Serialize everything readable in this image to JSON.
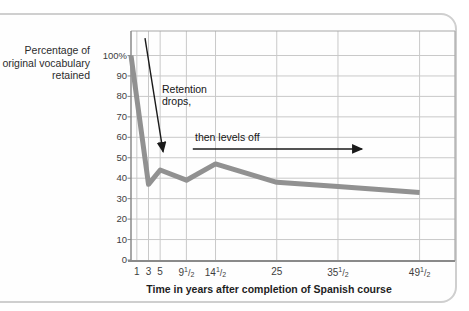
{
  "figure": {
    "y_axis_label_lines": [
      "Percentage of",
      "original vocabulary",
      "retained"
    ]
  },
  "chart_data": {
    "type": "line",
    "title": "",
    "xlabel": "Time in years after completion of Spanish course",
    "ylabel": "Percentage of original vocabulary retained",
    "series": [
      {
        "name": "vocabulary-retention",
        "points": [
          [
            0,
            100
          ],
          [
            3,
            37
          ],
          [
            5,
            44
          ],
          [
            9.5,
            39
          ],
          [
            14.5,
            47
          ],
          [
            25,
            38
          ],
          [
            35.5,
            36
          ],
          [
            49.5,
            33
          ]
        ]
      }
    ],
    "x_ticks": [
      {
        "year": 1,
        "label": "1"
      },
      {
        "year": 3,
        "label": "3"
      },
      {
        "year": 5,
        "label": "5"
      },
      {
        "year": 9.5,
        "label": "9 1/2"
      },
      {
        "year": 14.5,
        "label": "14 1/2"
      },
      {
        "year": 25,
        "label": "25"
      },
      {
        "year": 35.5,
        "label": "35 1/2"
      },
      {
        "year": 49.5,
        "label": "49 1/2"
      }
    ],
    "y_ticks": [
      {
        "value": 100,
        "label": "100%"
      },
      {
        "value": 90,
        "label": "90"
      },
      {
        "value": 80,
        "label": "80"
      },
      {
        "value": 70,
        "label": "70"
      },
      {
        "value": 60,
        "label": "60"
      },
      {
        "value": 50,
        "label": "50"
      },
      {
        "value": 40,
        "label": "40"
      },
      {
        "value": 30,
        "label": "30"
      },
      {
        "value": 20,
        "label": "20"
      },
      {
        "value": 10,
        "label": "10"
      },
      {
        "value": 0,
        "label": "0"
      }
    ],
    "xlim": [
      0,
      55.6
    ],
    "ylim": [
      0,
      112
    ],
    "grid": true,
    "legend": "none",
    "annotations": [
      {
        "text": "Retention drops,",
        "arrow_direction": "down",
        "arrow_from": [
          2.4,
          108.5
        ],
        "arrow_to": [
          5.5,
          53
        ]
      },
      {
        "text": "then levels off",
        "arrow_direction": "right",
        "arrow_from": [
          10.6,
          54.3
        ],
        "arrow_to": [
          39.6,
          54.3
        ]
      }
    ],
    "colors": {
      "line": "#919191",
      "grid": "#c9c9c9",
      "frame": "#a8a8a8",
      "axis": "#8a8a8a",
      "tick_text": "#3d3d3d",
      "annotation": "#1a1a1a",
      "card_border": "#cfcfcf"
    }
  }
}
